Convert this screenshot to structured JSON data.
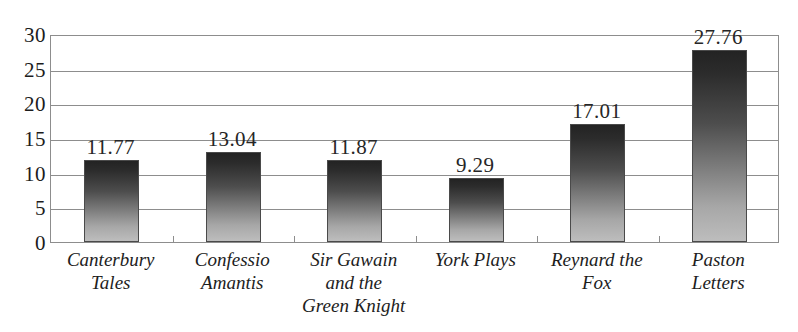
{
  "chart_data": {
    "type": "bar",
    "title": "",
    "subtitle": "",
    "xlabel": "",
    "ylabel": "",
    "ylim": [
      0,
      30
    ],
    "yticks": [
      0,
      5,
      10,
      15,
      20,
      25,
      30
    ],
    "ytick_labels": [
      "0",
      "5",
      "10",
      "15",
      "20",
      "25",
      "30"
    ],
    "grid": true,
    "legend": false,
    "legend_position": "none",
    "categories": [
      "Canterbury Tales",
      "Confessio Amantis",
      "Sir Gawain and the Green Knight",
      "York Plays",
      "Reynard the Fox",
      "Paston Letters"
    ],
    "category_lines": [
      [
        "Canterbury",
        "Tales"
      ],
      [
        "Confessio",
        "Amantis"
      ],
      [
        "Sir Gawain",
        "and the",
        "Green Knight"
      ],
      [
        "York Plays"
      ],
      [
        "Reynard the",
        "Fox"
      ],
      [
        "Paston",
        "Letters"
      ]
    ],
    "values": [
      11.77,
      13.04,
      11.87,
      9.29,
      17.01,
      27.76
    ],
    "value_labels": [
      "11.77",
      "13.04",
      "11.87",
      "9.29",
      "17.01",
      "27.76"
    ],
    "bar_style": {
      "gradient_top_color": "#232323",
      "gradient_bottom_color": "#bdbdbd",
      "border_color": "#4a4a4a"
    },
    "axis_color": "#8d8d8d",
    "text_color": "#1c1c1c",
    "background_color": "#ffffff"
  }
}
